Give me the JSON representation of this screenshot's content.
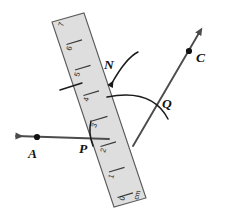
{
  "figure": {
    "background_color": "#ffffff",
    "ruler": {
      "fill_color": "#dedede",
      "edge_color": "#5a5a5a",
      "unit_label": "cm",
      "tick_numbers": [
        "0",
        "1",
        "2",
        "3",
        "4",
        "5",
        "6",
        "7"
      ]
    },
    "rays": {
      "color": "#4c4c4c",
      "ray_a_label": "A",
      "ray_c_label": "C"
    },
    "labels": {
      "point_a": "A",
      "point_p": "P",
      "point_n": "N",
      "point_q": "Q",
      "point_c": "C"
    },
    "arcs": {
      "color": "#1a1a1a"
    }
  }
}
